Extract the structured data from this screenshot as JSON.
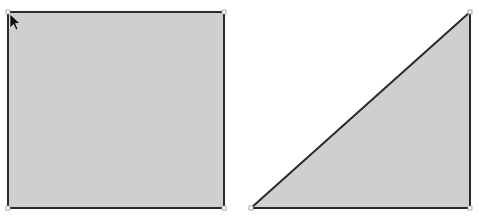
{
  "canvas": {
    "width": 479,
    "height": 220,
    "background": "#ffffff"
  },
  "shapes": {
    "square": {
      "x": 8,
      "y": 12,
      "width": 216,
      "height": 196,
      "fill": "#cfcfcf",
      "stroke": "#2a2a2a"
    },
    "triangle": {
      "points": "251,208 470,12 470,208",
      "fill": "#cfcfcf",
      "stroke": "#2a2a2a"
    }
  },
  "cursor": {
    "icon": "arrow-pointer-icon",
    "x": 9,
    "y": 13
  }
}
